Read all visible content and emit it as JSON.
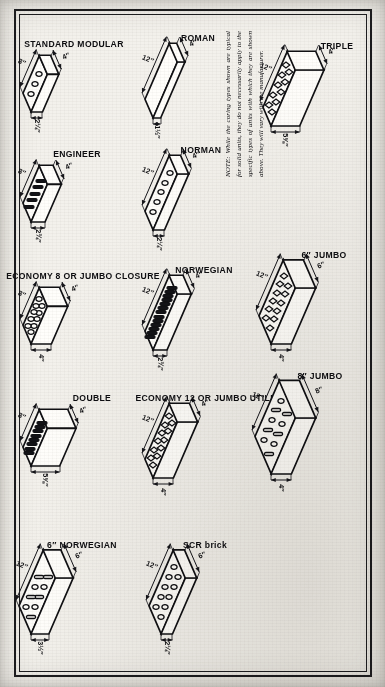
{
  "sheet": {
    "orientation": "landscape-drawing-rotated-90ccw",
    "border_color": "#101013",
    "paper_color": "#f3f1ec"
  },
  "note": {
    "lead": "NOTE:",
    "text": "While the coring types shown are typical for solid units, they do not necessarily apply to the specific types of units with which they are shown above. They will vary with the manufacturer."
  },
  "bricks": [
    {
      "id": "norwegian-6",
      "label": "6″ NORWEGIAN",
      "height": "3½″",
      "length": "12″",
      "width": "6″",
      "coring": "mixed-slot-round",
      "core_count": 9
    },
    {
      "id": "scr-brick",
      "label": "SCR brick",
      "height": "2¼″",
      "length": "12″",
      "width": "6″",
      "coring": "round",
      "core_count": 10
    },
    {
      "id": "double",
      "label": "DOUBLE",
      "height": "5⅝″",
      "length": "8″",
      "width": "4″",
      "coring": "slot",
      "core_count": 8
    },
    {
      "id": "economy-12-jumbo-utility",
      "label": "ECONOMY 12 OR JUMBO UTILITY",
      "height": "4″",
      "length": "12″",
      "width": "4″",
      "coring": "double-round",
      "core_count": 12
    },
    {
      "id": "jumbo-8",
      "label": "8″ JUMBO",
      "height": "4″",
      "length": "12″",
      "width": "8″",
      "coring": "mixed-slot-round",
      "core_count": 10
    },
    {
      "id": "economy-8-jumbo-closure",
      "label": "ECONOMY 8 OR JUMBO CLOSURE",
      "height": "4″",
      "length": "8″",
      "width": "4″",
      "coring": "round",
      "core_count": 10
    },
    {
      "id": "norwegian",
      "label": "NORWEGIAN",
      "height": "2¾″",
      "length": "12″",
      "width": "4″",
      "coring": "slot",
      "core_count": 13
    },
    {
      "id": "jumbo-6",
      "label": "6″ JUMBO",
      "height": "4″",
      "length": "12″",
      "width": "6″",
      "coring": "double-round",
      "core_count": 12
    },
    {
      "id": "engineer",
      "label": "ENGINEER",
      "height": "2¾″",
      "length": "8″",
      "width": "4″",
      "coring": "slot",
      "core_count": 5
    },
    {
      "id": "norman",
      "label": "NORMAN",
      "height": "2¼″",
      "length": "12″",
      "width": "4″",
      "coring": "round",
      "core_count": 5
    },
    {
      "id": "standard-modular",
      "label": "STANDARD MODULAR",
      "height": "2¼″",
      "length": "8″",
      "width": "4″",
      "coring": "round",
      "core_count": 3
    },
    {
      "id": "roman",
      "label": "ROMAN",
      "height": "1½″",
      "length": "12″",
      "width": "4″",
      "coring": "none",
      "core_count": 0
    },
    {
      "id": "triple",
      "label": "TRIPLE",
      "height": "5⅝″",
      "length": "12″",
      "width": "4″",
      "coring": "double-round",
      "core_count": 10
    }
  ]
}
